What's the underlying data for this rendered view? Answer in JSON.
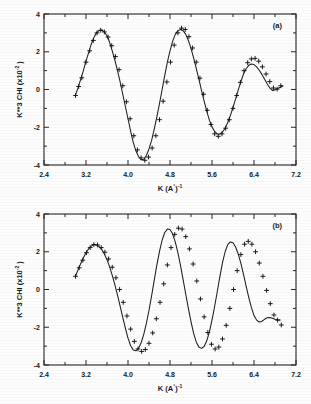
{
  "figure": {
    "title": "",
    "panels": [
      "a",
      "b"
    ]
  },
  "axis": {
    "xlabel_main": "K",
    "xlabel_unit_open": "(A",
    "xlabel_unit_deg": "°",
    "xlabel_unit_close": ")",
    "xlabel_unit_exp": "-1",
    "ylabel_main": "K**3 CHI  (x10",
    "ylabel_exp": "-2",
    "ylabel_close": " )"
  },
  "panel_a": {
    "tag": "(a)",
    "xticks": [
      "2.4",
      "3.2",
      "4.0",
      "4.8",
      "5.6",
      "6.4",
      "7.2"
    ],
    "yticks": [
      "4",
      "2",
      "0",
      "-2",
      "-4"
    ]
  },
  "panel_b": {
    "tag": "(b)",
    "xticks": [
      "2.4",
      "3.2",
      "4.0",
      "4.8",
      "5.6",
      "6.4",
      "7.2"
    ],
    "yticks": [
      "4",
      "2",
      "0",
      "-2",
      "-4"
    ]
  },
  "colors": {
    "ink": "#1d1d1d",
    "frame": "#262626",
    "paper": "#fdfdfd"
  },
  "chart_data": [
    {
      "type": "line",
      "id": "panel-a",
      "title": "(a)",
      "xlabel": "K (A°)^-1",
      "ylabel": "K**3 CHI (x10^-2 )",
      "xlim": [
        2.4,
        7.2
      ],
      "ylim": [
        -4,
        4
      ],
      "xticks": [
        2.4,
        3.2,
        4.0,
        4.8,
        5.6,
        6.4,
        7.2
      ],
      "yticks": [
        -4,
        -2,
        0,
        2,
        4
      ],
      "grid": false,
      "legend": false,
      "series": [
        {
          "name": "fit",
          "marker": "none",
          "style": "solid-line",
          "x": [
            3.0,
            3.05,
            3.1,
            3.15,
            3.2,
            3.25,
            3.3,
            3.35,
            3.4,
            3.45,
            3.5,
            3.55,
            3.6,
            3.65,
            3.7,
            3.75,
            3.8,
            3.85,
            3.9,
            3.95,
            4.0,
            4.05,
            4.1,
            4.15,
            4.2,
            4.25,
            4.3,
            4.35,
            4.4,
            4.45,
            4.5,
            4.55,
            4.6,
            4.65,
            4.7,
            4.75,
            4.8,
            4.85,
            4.9,
            4.95,
            5.0,
            5.05,
            5.1,
            5.15,
            5.2,
            5.25,
            5.3,
            5.35,
            5.4,
            5.45,
            5.5,
            5.55,
            5.6,
            5.65,
            5.7,
            5.75,
            5.8,
            5.85,
            5.9,
            5.95,
            6.0,
            6.05,
            6.1,
            6.15,
            6.2,
            6.25,
            6.3,
            6.35,
            6.4,
            6.45,
            6.5,
            6.55,
            6.6,
            6.65,
            6.7,
            6.75,
            6.8,
            6.85,
            6.9,
            6.95
          ],
          "y": [
            -0.3,
            0.1,
            0.55,
            1.0,
            1.5,
            1.95,
            2.4,
            2.75,
            3.0,
            3.13,
            3.15,
            3.05,
            2.85,
            2.5,
            2.05,
            1.55,
            1.0,
            0.4,
            -0.25,
            -0.9,
            -1.55,
            -2.2,
            -2.8,
            -3.25,
            -3.55,
            -3.72,
            -3.7,
            -3.5,
            -3.15,
            -2.7,
            -2.1,
            -1.45,
            -0.75,
            0.0,
            0.75,
            1.45,
            2.05,
            2.55,
            2.92,
            3.12,
            3.18,
            3.12,
            2.92,
            2.6,
            2.18,
            1.68,
            1.12,
            0.55,
            -0.05,
            -0.62,
            -1.15,
            -1.62,
            -1.98,
            -2.22,
            -2.35,
            -2.36,
            -2.25,
            -2.05,
            -1.75,
            -1.38,
            -0.95,
            -0.5,
            -0.02,
            0.42,
            0.82,
            1.1,
            1.28,
            1.35,
            1.32,
            1.2,
            1.02,
            0.8,
            0.55,
            0.3,
            0.08,
            -0.05,
            -0.02,
            0.05,
            0.12,
            0.18
          ]
        },
        {
          "name": "data",
          "marker": "plus",
          "style": "markers",
          "x": [
            3.0,
            3.06,
            3.12,
            3.2,
            3.27,
            3.34,
            3.41,
            3.48,
            3.55,
            3.62,
            3.69,
            3.76,
            3.83,
            3.9,
            3.97,
            4.04,
            4.11,
            4.18,
            4.25,
            4.32,
            4.39,
            4.46,
            4.53,
            4.6,
            4.67,
            4.74,
            4.81,
            4.88,
            4.95,
            5.02,
            5.09,
            5.16,
            5.23,
            5.3,
            5.37,
            5.44,
            5.51,
            5.58,
            5.65,
            5.72,
            5.79,
            5.86,
            5.93,
            6.0,
            6.07,
            6.14,
            6.21,
            6.28,
            6.35,
            6.42,
            6.49,
            6.56,
            6.63,
            6.7,
            6.77,
            6.84,
            6.91
          ],
          "y": [
            -0.32,
            0.16,
            0.62,
            1.45,
            2.05,
            2.6,
            3.0,
            3.14,
            3.05,
            2.78,
            2.32,
            1.75,
            1.05,
            0.2,
            -0.65,
            -1.55,
            -2.45,
            -3.2,
            -3.62,
            -3.75,
            -3.58,
            -3.1,
            -2.45,
            -1.6,
            -0.62,
            0.4,
            1.45,
            2.35,
            3.0,
            3.25,
            3.18,
            2.8,
            2.2,
            1.45,
            0.6,
            -0.25,
            -1.1,
            -1.85,
            -2.35,
            -2.48,
            -2.35,
            -2.05,
            -1.6,
            -1.0,
            -0.32,
            0.38,
            1.0,
            1.42,
            1.62,
            1.65,
            1.5,
            1.2,
            0.82,
            0.42,
            0.08,
            0.02,
            0.2
          ]
        }
      ]
    },
    {
      "type": "line",
      "id": "panel-b",
      "title": "(b)",
      "xlabel": "K (A°)^-1",
      "ylabel": "K**3 CHI (x10^-2 )",
      "xlim": [
        2.4,
        7.2
      ],
      "ylim": [
        -4,
        4
      ],
      "xticks": [
        2.4,
        3.2,
        4.0,
        4.8,
        5.6,
        6.4,
        7.2
      ],
      "yticks": [
        -4,
        -2,
        0,
        2,
        4
      ],
      "grid": false,
      "legend": false,
      "series": [
        {
          "name": "fit",
          "marker": "none",
          "style": "solid-line",
          "x": [
            3.0,
            3.05,
            3.1,
            3.15,
            3.2,
            3.25,
            3.3,
            3.35,
            3.4,
            3.45,
            3.5,
            3.55,
            3.6,
            3.65,
            3.7,
            3.75,
            3.8,
            3.85,
            3.9,
            3.95,
            4.0,
            4.05,
            4.1,
            4.15,
            4.2,
            4.25,
            4.3,
            4.35,
            4.4,
            4.45,
            4.5,
            4.55,
            4.6,
            4.65,
            4.7,
            4.75,
            4.8,
            4.85,
            4.9,
            4.95,
            5.0,
            5.05,
            5.1,
            5.15,
            5.2,
            5.25,
            5.3,
            5.35,
            5.4,
            5.45,
            5.5,
            5.55,
            5.6,
            5.65,
            5.7,
            5.75,
            5.8,
            5.85,
            5.9,
            5.95,
            6.0,
            6.05,
            6.1,
            6.15,
            6.2,
            6.25,
            6.3,
            6.35,
            6.4,
            6.45,
            6.5,
            6.55,
            6.6,
            6.65,
            6.7,
            6.75,
            6.8,
            6.85,
            6.9
          ],
          "y": [
            0.7,
            1.05,
            1.38,
            1.68,
            1.95,
            2.15,
            2.3,
            2.38,
            2.36,
            2.28,
            2.12,
            1.88,
            1.58,
            1.2,
            0.75,
            0.25,
            -0.3,
            -0.88,
            -1.48,
            -2.05,
            -2.58,
            -2.98,
            -3.2,
            -3.25,
            -3.12,
            -2.82,
            -2.38,
            -1.8,
            -1.1,
            -0.32,
            0.5,
            1.3,
            2.02,
            2.62,
            3.02,
            3.2,
            3.18,
            2.95,
            2.52,
            1.95,
            1.28,
            0.52,
            -0.25,
            -1.0,
            -1.7,
            -2.32,
            -2.78,
            -3.05,
            -3.12,
            -3.02,
            -2.72,
            -2.25,
            -1.62,
            -0.9,
            -0.12,
            0.68,
            1.42,
            2.0,
            2.38,
            2.52,
            2.48,
            2.25,
            1.88,
            1.38,
            0.8,
            0.18,
            -0.42,
            -0.95,
            -1.38,
            -1.62,
            -1.72,
            -1.68,
            -1.58,
            -1.5,
            -1.48,
            -1.52,
            -1.58,
            -1.62,
            -1.62
          ]
        },
        {
          "name": "data",
          "marker": "plus",
          "style": "markers",
          "x": [
            3.0,
            3.07,
            3.14,
            3.21,
            3.28,
            3.35,
            3.42,
            3.49,
            3.56,
            3.63,
            3.7,
            3.77,
            3.84,
            3.91,
            3.98,
            4.05,
            4.12,
            4.19,
            4.26,
            4.33,
            4.4,
            4.47,
            4.54,
            4.61,
            4.68,
            4.75,
            4.82,
            4.89,
            4.96,
            5.03,
            5.1,
            5.17,
            5.24,
            5.31,
            5.38,
            5.45,
            5.52,
            5.59,
            5.66,
            5.73,
            5.8,
            5.87,
            5.94,
            6.01,
            6.08,
            6.15,
            6.22,
            6.29,
            6.36,
            6.43,
            6.5,
            6.57,
            6.64,
            6.71,
            6.78,
            6.85,
            6.92
          ],
          "y": [
            0.7,
            1.15,
            1.55,
            1.95,
            2.22,
            2.38,
            2.36,
            2.22,
            1.98,
            1.62,
            1.18,
            0.62,
            0.0,
            -0.68,
            -1.4,
            -2.1,
            -2.75,
            -3.15,
            -3.28,
            -3.18,
            -2.85,
            -2.3,
            -1.55,
            -0.68,
            0.3,
            1.3,
            2.22,
            2.92,
            3.25,
            3.2,
            2.8,
            2.15,
            1.35,
            0.45,
            -0.5,
            -1.45,
            -2.28,
            -2.9,
            -3.15,
            -3.05,
            -2.62,
            -1.9,
            -1.0,
            0.0,
            1.0,
            1.85,
            2.4,
            2.55,
            2.4,
            2.0,
            1.4,
            0.7,
            -0.05,
            -0.75,
            -1.35,
            -1.62,
            -1.88
          ]
        }
      ]
    }
  ]
}
